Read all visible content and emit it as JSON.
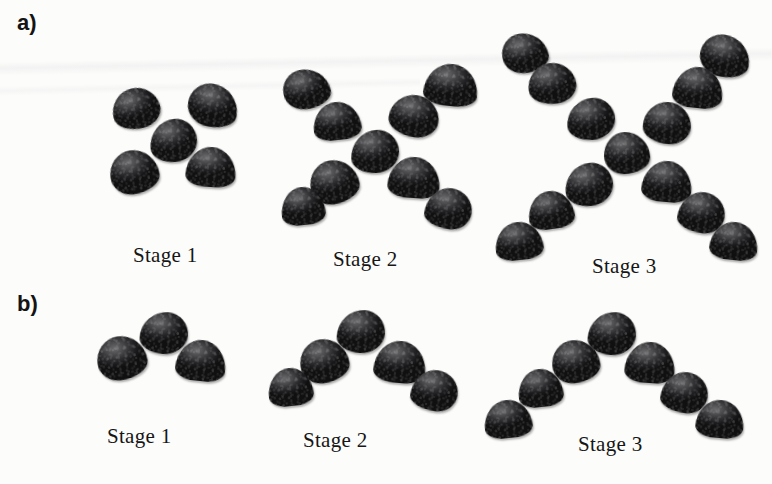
{
  "figure": {
    "background_color": "#fcfcfb",
    "bean_color": "#2e2e30",
    "text_color": "#161616"
  },
  "panels": [
    {
      "letter": "a)",
      "pattern_name": "x-shape",
      "stages": [
        {
          "label": "Stage 1",
          "count": 5,
          "label_pos": {
            "x": 133,
            "y": 243
          },
          "beans": [
            {
              "x": 112,
              "y": 88,
              "rot": -14,
              "v": "v1",
              "w": 48,
              "h": 41
            },
            {
              "x": 188,
              "y": 84,
              "rot": 10,
              "v": "v2",
              "w": 50,
              "h": 43
            },
            {
              "x": 150,
              "y": 119,
              "rot": -5,
              "v": "v3",
              "w": 47,
              "h": 43
            },
            {
              "x": 110,
              "y": 150,
              "rot": -8,
              "v": "v4",
              "w": 49,
              "h": 44
            },
            {
              "x": 186,
              "y": 147,
              "rot": 4,
              "v": "dome",
              "w": 50,
              "h": 40
            }
          ]
        },
        {
          "label": "Stage 2",
          "count": 9,
          "label_pos": {
            "x": 333,
            "y": 247
          },
          "beans": [
            {
              "x": 283,
              "y": 69,
              "rot": -12,
              "v": "v2",
              "w": 47,
              "h": 40
            },
            {
              "x": 313,
              "y": 102,
              "rot": -6,
              "v": "dome",
              "w": 48,
              "h": 38
            },
            {
              "x": 389,
              "y": 95,
              "rot": 8,
              "v": "v1",
              "w": 50,
              "h": 42
            },
            {
              "x": 424,
              "y": 64,
              "rot": 6,
              "v": "dome",
              "w": 54,
              "h": 42
            },
            {
              "x": 351,
              "y": 130,
              "rot": -3,
              "v": "v3",
              "w": 48,
              "h": 43
            },
            {
              "x": 310,
              "y": 160,
              "rot": -10,
              "v": "v4",
              "w": 49,
              "h": 44
            },
            {
              "x": 281,
              "y": 187,
              "rot": -6,
              "v": "dome",
              "w": 44,
              "h": 38
            },
            {
              "x": 388,
              "y": 157,
              "rot": 4,
              "v": "dome",
              "w": 52,
              "h": 41
            },
            {
              "x": 425,
              "y": 188,
              "rot": 8,
              "v": "v5",
              "w": 47,
              "h": 41
            }
          ]
        },
        {
          "label": "Stage 3",
          "count": 13,
          "label_pos": {
            "x": 592,
            "y": 254
          },
          "beans": [
            {
              "x": 502,
              "y": 33,
              "rot": -10,
              "v": "v2",
              "w": 46,
              "h": 40
            },
            {
              "x": 528,
              "y": 63,
              "rot": -8,
              "v": "v1",
              "w": 48,
              "h": 41
            },
            {
              "x": 567,
              "y": 98,
              "rot": -4,
              "v": "v3",
              "w": 48,
              "h": 42
            },
            {
              "x": 700,
              "y": 35,
              "rot": 10,
              "v": "v2",
              "w": 50,
              "h": 42
            },
            {
              "x": 673,
              "y": 67,
              "rot": 6,
              "v": "dome",
              "w": 50,
              "h": 41
            },
            {
              "x": 643,
              "y": 102,
              "rot": 3,
              "v": "v1",
              "w": 48,
              "h": 42
            },
            {
              "x": 604,
              "y": 132,
              "rot": -2,
              "v": "v4",
              "w": 46,
              "h": 42
            },
            {
              "x": 565,
              "y": 163,
              "rot": -6,
              "v": "v3",
              "w": 48,
              "h": 43
            },
            {
              "x": 528,
              "y": 191,
              "rot": -8,
              "v": "dome",
              "w": 46,
              "h": 38
            },
            {
              "x": 495,
              "y": 222,
              "rot": -6,
              "v": "dome",
              "w": 48,
              "h": 38
            },
            {
              "x": 642,
              "y": 161,
              "rot": 5,
              "v": "dome",
              "w": 50,
              "h": 41
            },
            {
              "x": 678,
              "y": 192,
              "rot": 8,
              "v": "v5",
              "w": 47,
              "h": 41
            },
            {
              "x": 710,
              "y": 222,
              "rot": 6,
              "v": "dome",
              "w": 48,
              "h": 38
            }
          ]
        }
      ]
    },
    {
      "letter": "b)",
      "pattern_name": "arch-shape",
      "stages": [
        {
          "label": "Stage 1",
          "count": 3,
          "label_pos": {
            "x": 107,
            "y": 424
          },
          "beans": [
            {
              "x": 140,
              "y": 312,
              "rot": 4,
              "v": "v3",
              "w": 48,
              "h": 42
            },
            {
              "x": 97,
              "y": 336,
              "rot": -8,
              "v": "v4",
              "w": 50,
              "h": 44
            },
            {
              "x": 176,
              "y": 340,
              "rot": 6,
              "v": "dome",
              "w": 50,
              "h": 41
            }
          ]
        },
        {
          "label": "Stage 2",
          "count": 5,
          "label_pos": {
            "x": 303,
            "y": 428
          },
          "beans": [
            {
              "x": 337,
              "y": 310,
              "rot": 3,
              "v": "v3",
              "w": 48,
              "h": 43
            },
            {
              "x": 300,
              "y": 339,
              "rot": -8,
              "v": "v4",
              "w": 49,
              "h": 44
            },
            {
              "x": 268,
              "y": 368,
              "rot": -6,
              "v": "dome",
              "w": 45,
              "h": 38
            },
            {
              "x": 374,
              "y": 341,
              "rot": 5,
              "v": "dome",
              "w": 52,
              "h": 42
            },
            {
              "x": 411,
              "y": 370,
              "rot": 8,
              "v": "v5",
              "w": 47,
              "h": 41
            }
          ]
        },
        {
          "label": "Stage 3",
          "count": 7,
          "label_pos": {
            "x": 578,
            "y": 432
          },
          "beans": [
            {
              "x": 588,
              "y": 312,
              "rot": 4,
              "v": "v3",
              "w": 48,
              "h": 43
            },
            {
              "x": 552,
              "y": 340,
              "rot": -6,
              "v": "v4",
              "w": 48,
              "h": 43
            },
            {
              "x": 518,
              "y": 369,
              "rot": -6,
              "v": "dome",
              "w": 45,
              "h": 38
            },
            {
              "x": 484,
              "y": 400,
              "rot": -6,
              "v": "dome",
              "w": 48,
              "h": 38
            },
            {
              "x": 625,
              "y": 342,
              "rot": 4,
              "v": "dome",
              "w": 50,
              "h": 41
            },
            {
              "x": 661,
              "y": 372,
              "rot": 7,
              "v": "v5",
              "w": 47,
              "h": 41
            },
            {
              "x": 696,
              "y": 400,
              "rot": 5,
              "v": "dome",
              "w": 48,
              "h": 38
            }
          ]
        }
      ]
    }
  ]
}
